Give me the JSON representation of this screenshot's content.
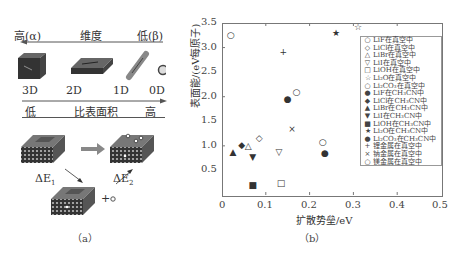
{
  "panel_a": {
    "dimension_axis": {
      "left": "高(α)",
      "center": "维度",
      "right": "低(β)"
    },
    "shapes": [
      {
        "label": "3D"
      },
      {
        "label": "2D"
      },
      {
        "label": "1D"
      },
      {
        "label": "0D"
      }
    ],
    "surface_axis": {
      "left": "低",
      "center": "比表面积",
      "right": "高"
    },
    "energy_labels": {
      "e1": "ΔE",
      "e1_sub": "1",
      "e2": "ΔE",
      "e2_sub": "2",
      "plus": "+"
    },
    "caption": "（a）"
  },
  "panel_b": {
    "caption": "（b）"
  },
  "chart_data": {
    "type": "scatter",
    "title": "",
    "xlabel": "扩散势垒/eV",
    "ylabel": "表面能/(eV每原子)",
    "xlim": [
      0,
      0.5
    ],
    "ylim": [
      0,
      3.5
    ],
    "xticks": [
      "0",
      "0.1",
      "0.2",
      "0.3",
      "0.4",
      "0.5"
    ],
    "yticks": [
      "0.5",
      "1.0",
      "1.5",
      "2.0",
      "2.5",
      "3.0",
      "3.5"
    ],
    "legend_position": "right-inside",
    "series": [
      {
        "name": "LiF在真空中",
        "marker": "○",
        "x": 0.23,
        "y": 1.07
      },
      {
        "name": "LiCl在真空中",
        "marker": "◇",
        "x": 0.085,
        "y": 1.15
      },
      {
        "name": "LiBr在真空中",
        "marker": "△",
        "x": 0.06,
        "y": 1.0
      },
      {
        "name": "LiI在真空中",
        "marker": "▽",
        "x": 0.13,
        "y": 0.88
      },
      {
        "name": "LiOH在真空中",
        "marker": "□",
        "x": 0.135,
        "y": 0.25
      },
      {
        "name": "Li₂O在真空中",
        "marker": "☆",
        "x": 0.31,
        "y": 3.42
      },
      {
        "name": "Li₂CO₃在真空中",
        "marker": "○",
        "x": 0.17,
        "y": 2.1
      },
      {
        "name": "LiF在CH₃CN中",
        "marker": "●",
        "x": 0.235,
        "y": 0.86
      },
      {
        "name": "LiCl在CH₃CN中",
        "marker": "◆",
        "x": 0.045,
        "y": 1.02
      },
      {
        "name": "LiBr在CH₃CN中",
        "marker": "▲",
        "x": 0.025,
        "y": 0.87
      },
      {
        "name": "LiI在CH₃CN中",
        "marker": "▼",
        "x": 0.07,
        "y": 0.78
      },
      {
        "name": "LiOH在CH₃CN中",
        "marker": "■",
        "x": 0.07,
        "y": 0.2
      },
      {
        "name": "Li₂O在CH₃CN中",
        "marker": "★",
        "x": 0.26,
        "y": 3.3
      },
      {
        "name": "Li₂CO₃在CH₃CN中",
        "marker": "●",
        "x": 0.15,
        "y": 1.95
      },
      {
        "name": "锂金属在真空中",
        "marker": "+",
        "x": 0.14,
        "y": 2.9
      },
      {
        "name": "钠金属在真空中",
        "marker": "×",
        "x": 0.16,
        "y": 1.35
      },
      {
        "name": "镁金属在真空中",
        "marker": "○",
        "x": 0.02,
        "y": 3.25
      }
    ]
  }
}
